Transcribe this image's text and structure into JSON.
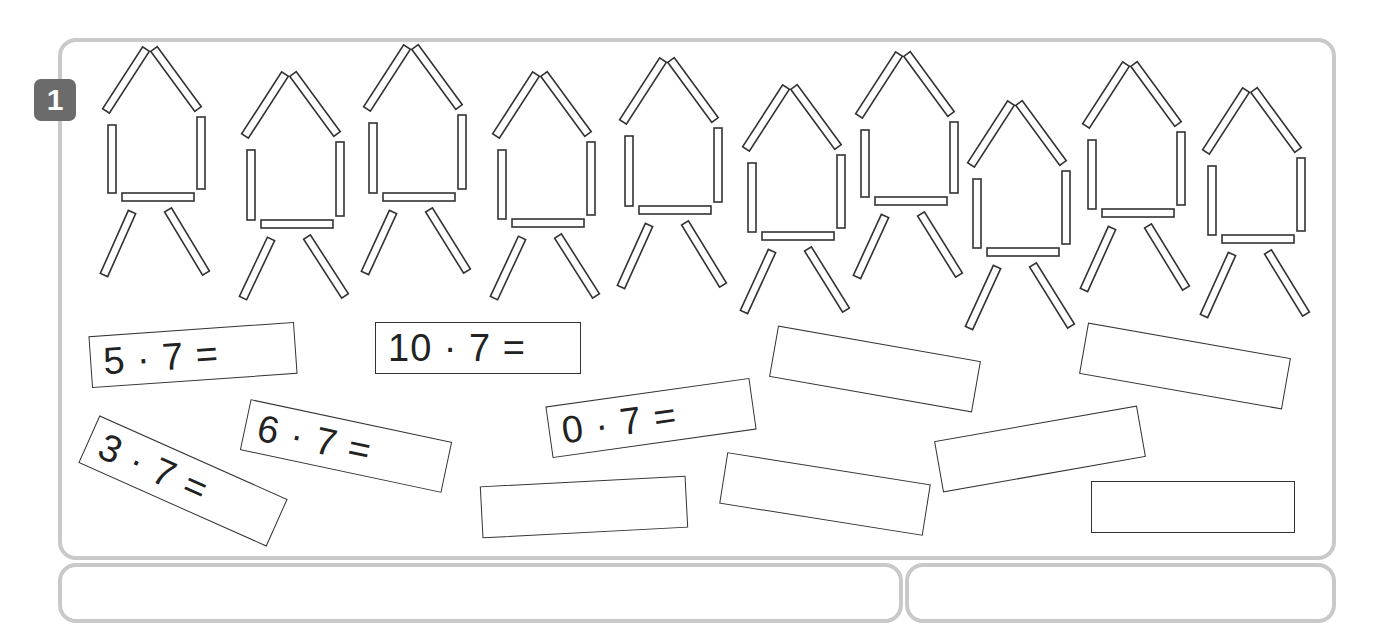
{
  "task": {
    "number": "1",
    "figure_count": 10,
    "sticks_per_figure": 7
  },
  "equations": [
    {
      "id": "eq-5",
      "text": "5 · 7 =",
      "left": 90,
      "top": 329,
      "width": 206,
      "rotate": -4
    },
    {
      "id": "eq-10",
      "text": "10 · 7 =",
      "left": 375,
      "top": 322,
      "width": 206,
      "rotate": 0
    },
    {
      "id": "eq-6",
      "text": "6 · 7 =",
      "left": 243,
      "top": 420,
      "width": 206,
      "rotate": 12
    },
    {
      "id": "eq-3",
      "text": "3 · 7 =",
      "left": 80,
      "top": 455,
      "width": 206,
      "rotate": 24
    },
    {
      "id": "eq-0",
      "text": "0 · 7 =",
      "left": 548,
      "top": 392,
      "width": 206,
      "rotate": -8
    }
  ],
  "blank_boxes": [
    {
      "id": "blank-1",
      "left": 772,
      "top": 343,
      "width": 206,
      "rotate": 10
    },
    {
      "id": "blank-2",
      "left": 1082,
      "top": 340,
      "width": 206,
      "rotate": 10
    },
    {
      "id": "blank-3",
      "left": 937,
      "top": 423,
      "width": 206,
      "rotate": -10
    },
    {
      "id": "blank-4",
      "left": 481,
      "top": 481,
      "width": 206,
      "rotate": -3
    },
    {
      "id": "blank-5",
      "left": 722,
      "top": 468,
      "width": 206,
      "rotate": 9
    },
    {
      "id": "blank-6",
      "left": 1091,
      "top": 481,
      "width": 204,
      "rotate": 0
    }
  ],
  "figures": [
    {
      "ax": 150,
      "ay": 47,
      "base": 194,
      "legs": 275
    },
    {
      "ax": 289,
      "ay": 72,
      "base": 221,
      "legs": 298
    },
    {
      "ax": 411,
      "ay": 45,
      "base": 194,
      "legs": 273
    },
    {
      "ax": 540,
      "ay": 72,
      "base": 220,
      "legs": 298
    },
    {
      "ax": 667,
      "ay": 58,
      "base": 207,
      "legs": 287
    },
    {
      "ax": 790,
      "ay": 85,
      "base": 233,
      "legs": 312
    },
    {
      "ax": 903,
      "ay": 52,
      "base": 198,
      "legs": 277
    },
    {
      "ax": 1015,
      "ay": 101,
      "base": 249,
      "legs": 328
    },
    {
      "ax": 1130,
      "ay": 62,
      "base": 210,
      "legs": 290
    },
    {
      "ax": 1250,
      "ay": 88,
      "base": 236,
      "legs": 316
    }
  ],
  "colors": {
    "panel_border": "#c9c9c9",
    "badge": "#6b6b6b",
    "stroke": "#333333"
  }
}
